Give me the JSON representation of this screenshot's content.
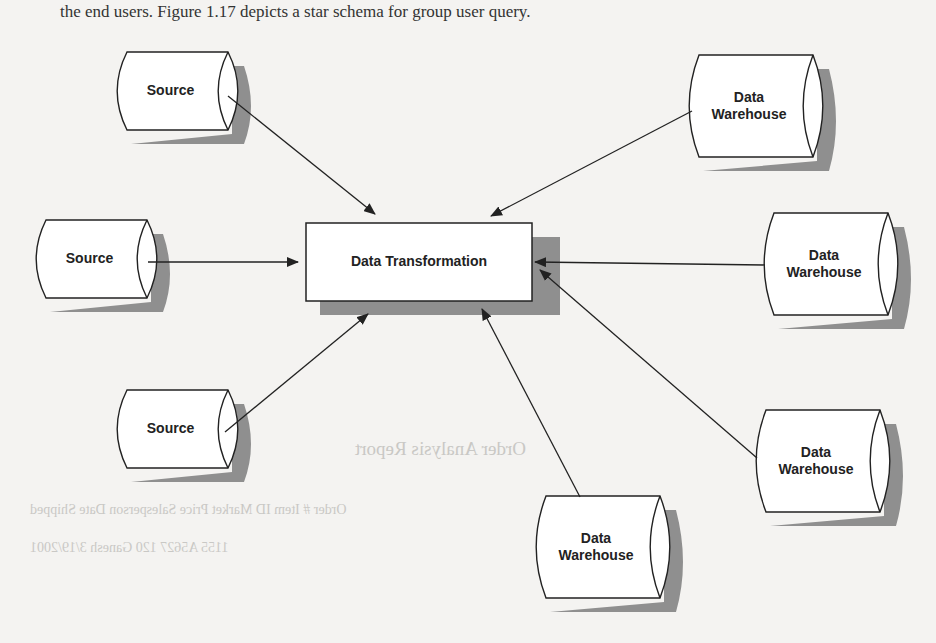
{
  "header_text": "the end users. Figure 1.17 depicts a star schema for group user query.",
  "center": {
    "label": "Data Transformation"
  },
  "sources": [
    {
      "label": "Source",
      "x": 113,
      "y": 52
    },
    {
      "label": "Source",
      "x": 32,
      "y": 220
    },
    {
      "label": "Source",
      "x": 113,
      "y": 390
    }
  ],
  "warehouses": [
    {
      "label": "Data Warehouse",
      "x": 685,
      "y": 55
    },
    {
      "label": "Data Warehouse",
      "x": 760,
      "y": 213
    },
    {
      "label": "Data Warehouse",
      "x": 752,
      "y": 410
    },
    {
      "label": "Data Warehouse",
      "x": 532,
      "y": 496
    }
  ],
  "bleed_through": {
    "report_title": "Order Analysis Report",
    "columns": "Order #   Item ID   Market   Price   Salesperson   Date Shipped",
    "row": "1155   A5627   120   Ganesh   3/19/2001"
  }
}
